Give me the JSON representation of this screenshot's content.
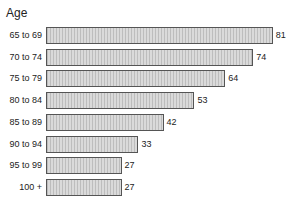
{
  "chart_data": {
    "type": "bar",
    "orientation": "horizontal",
    "title": "",
    "ylabel": "Age",
    "xlabel": "",
    "categories": [
      "65 to 69",
      "70 to 74",
      "75 to 79",
      "80 to 84",
      "85 to 89",
      "90 to 94",
      "95 to 99",
      "100 +"
    ],
    "values": [
      81,
      74,
      64,
      53,
      42,
      33,
      27,
      27
    ],
    "data_labels": true,
    "grid": false,
    "legend": null,
    "bar_fill": "#cfcfcf",
    "bar_border": "#555555"
  },
  "axis": {
    "title": "Age"
  }
}
